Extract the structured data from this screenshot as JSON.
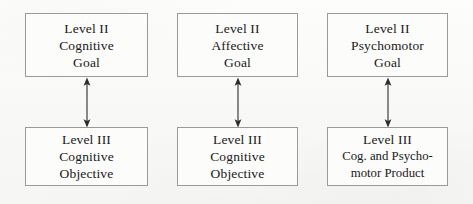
{
  "diagram": {
    "type": "flow-diagram",
    "background_color": "#fbfbfa",
    "box_border_color": "#9a9a98",
    "text_color": "#191919",
    "arrow_color": "#2c2c2c",
    "columns": [
      {
        "id": "cognitive",
        "goal": {
          "lines": [
            "Level II",
            "Cognitive",
            "Goal"
          ]
        },
        "objective": {
          "lines": [
            "Level III",
            "Cognitive",
            "Objective"
          ]
        },
        "connector": {
          "style": "double-headed-vertical-arrow"
        }
      },
      {
        "id": "affective",
        "goal": {
          "lines": [
            "Level II",
            "Affective",
            "Goal"
          ]
        },
        "objective": {
          "lines": [
            "Level III",
            "Cognitive",
            "Objective"
          ]
        },
        "connector": {
          "style": "double-headed-vertical-arrow"
        }
      },
      {
        "id": "psychomotor",
        "goal": {
          "lines": [
            "Level II",
            "Psychomotor",
            "Goal"
          ]
        },
        "objective": {
          "lines": [
            "Level III",
            "Cog. and Psycho-",
            "motor Product"
          ]
        },
        "connector": {
          "style": "double-headed-vertical-arrow"
        }
      }
    ]
  }
}
